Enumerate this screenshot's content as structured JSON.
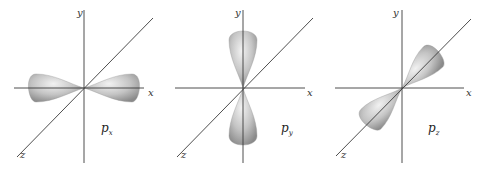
{
  "figure": {
    "panels": [
      {
        "id": "px",
        "orbital": "p",
        "subscript": "x",
        "lobe_axis": "x",
        "axis_labels": {
          "x": "x",
          "y": "y",
          "z": "z"
        }
      },
      {
        "id": "py",
        "orbital": "p",
        "subscript": "y",
        "lobe_axis": "y",
        "axis_labels": {
          "x": "x",
          "y": "y",
          "z": "z"
        }
      },
      {
        "id": "pz",
        "orbital": "p",
        "subscript": "z",
        "lobe_axis": "z",
        "axis_labels": {
          "x": "x",
          "y": "y",
          "z": "z"
        }
      }
    ],
    "colors": {
      "axis": "#3a3a3a",
      "lobe_light": "#e6e6e6",
      "lobe_dark": "#8c8c8c",
      "background": "#ffffff"
    }
  }
}
